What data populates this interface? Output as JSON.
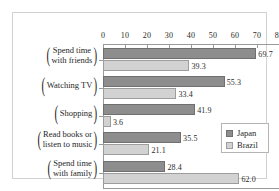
{
  "chart_data": {
    "type": "bar",
    "orientation": "horizontal",
    "title": "",
    "xlabel": "",
    "ylabel": "",
    "xlim": [
      0,
      80
    ],
    "xticks": [
      0,
      10,
      20,
      30,
      40,
      50,
      60,
      70,
      80
    ],
    "grid": false,
    "legend_position": "middle-right",
    "categories": [
      {
        "line1": "Spend time",
        "line2": "with friends"
      },
      {
        "line1": "Watching TV",
        "line2": ""
      },
      {
        "line1": "Shopping",
        "line2": ""
      },
      {
        "line1": "Read books or",
        "line2": "listen to music"
      },
      {
        "line1": "Spend time",
        "line2": "with family"
      }
    ],
    "series": [
      {
        "name": "Japan",
        "color": "#8d8d8d",
        "values": [
          69.7,
          55.3,
          41.9,
          35.5,
          28.4
        ],
        "labels": [
          "69.7",
          "55.3",
          "41.9",
          "35.5",
          "28.4"
        ]
      },
      {
        "name": "Brazil",
        "color": "#d2d2d2",
        "values": [
          39.3,
          33.4,
          3.6,
          21.1,
          62.0
        ],
        "labels": [
          "39.3",
          "33.4",
          "3.6",
          "21.1",
          "62.0"
        ]
      }
    ]
  },
  "legend": {
    "entries": [
      {
        "label": "Japan",
        "color": "#8d8d8d"
      },
      {
        "label": "Brazil",
        "color": "#d2d2d2"
      }
    ]
  },
  "axis": {
    "tick_labels": [
      "0",
      "10",
      "20",
      "30",
      "40",
      "50",
      "60",
      "70",
      "80"
    ]
  }
}
